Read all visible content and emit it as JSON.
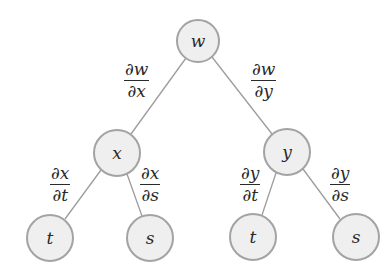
{
  "diagram": {
    "type": "tree",
    "colors": {
      "node_fill": "#efefef",
      "node_stroke": "#a3a3a3",
      "edge": "#9c9c9c",
      "text": "#2a2a2a"
    },
    "nodes": [
      {
        "id": "w",
        "label": "w",
        "cx": 198,
        "cy": 41,
        "r": 21
      },
      {
        "id": "x",
        "label": "x",
        "cx": 117,
        "cy": 153,
        "r": 23
      },
      {
        "id": "y",
        "label": "y",
        "cx": 287,
        "cy": 152,
        "r": 23
      },
      {
        "id": "t1",
        "label": "t",
        "cx": 50,
        "cy": 238,
        "r": 23
      },
      {
        "id": "s1",
        "label": "s",
        "cx": 150,
        "cy": 238,
        "r": 23
      },
      {
        "id": "t2",
        "label": "t",
        "cx": 253,
        "cy": 237,
        "r": 23
      },
      {
        "id": "s2",
        "label": "s",
        "cx": 356,
        "cy": 237,
        "r": 23
      }
    ],
    "edges": [
      {
        "from": "w",
        "to": "x",
        "label_num": "∂w",
        "label_den": "∂x"
      },
      {
        "from": "w",
        "to": "y",
        "label_num": "∂w",
        "label_den": "∂y"
      },
      {
        "from": "x",
        "to": "t1",
        "label_num": "∂x",
        "label_den": "∂t"
      },
      {
        "from": "x",
        "to": "s1",
        "label_num": "∂x",
        "label_den": "∂s"
      },
      {
        "from": "y",
        "to": "t2",
        "label_num": "∂y",
        "label_den": "∂t"
      },
      {
        "from": "y",
        "to": "s2",
        "label_num": "∂y",
        "label_den": "∂s"
      }
    ]
  }
}
